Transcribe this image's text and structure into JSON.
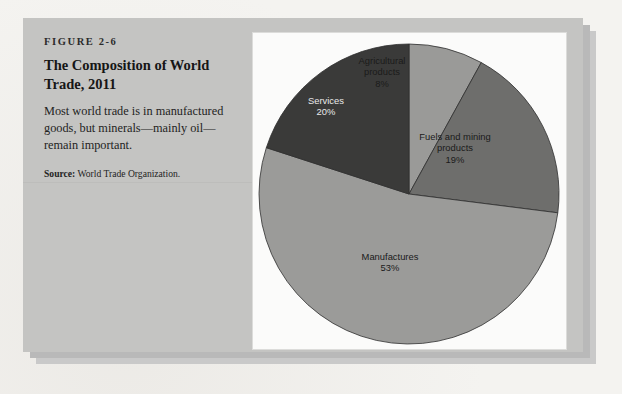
{
  "figure": {
    "number": "FIGURE 2-6",
    "title": "The Composition of World Trade, 2011",
    "description": "Most world trade is in manufactured goods, but minerals—mainly oil—remain important.",
    "source_label": "Source:",
    "source_text": " World Trade Organization."
  },
  "chart_data": {
    "type": "pie",
    "title": "The Composition of World Trade, 2011",
    "subtitle": "",
    "xlabel": "",
    "ylabel": "",
    "legend_position": "none",
    "grid": false,
    "units": "percent",
    "start_angle_deg": 0,
    "direction": "clockwise",
    "categories": [
      "Agricultural products",
      "Fuels and mining products",
      "Manufactures",
      "Services"
    ],
    "values": [
      8,
      19,
      53,
      20
    ],
    "slices": [
      {
        "name": "Agricultural products",
        "value": 8,
        "value_label": "8%",
        "label_line1": "Agricultural",
        "label_line2": "products",
        "color": "#9a9a98",
        "text_color": "light"
      },
      {
        "name": "Fuels and mining products",
        "value": 19,
        "value_label": "19%",
        "label_line1": "Fuels and mining",
        "label_line2": "products",
        "color": "#6e6e6c",
        "text_color": "light"
      },
      {
        "name": "Manufactures",
        "value": 53,
        "value_label": "53%",
        "label_line1": "Manufactures",
        "label_line2": "",
        "color": "#9b9b99",
        "text_color": "light"
      },
      {
        "name": "Services",
        "value": 20,
        "value_label": "20%",
        "label_line1": "Services",
        "label_line2": "",
        "color": "#3a3a39",
        "text_color": "dark"
      }
    ]
  },
  "colors": {
    "panel_background": "#c4c4c2",
    "chart_background": "#fbfbfa",
    "page_background": "#f3f2ef",
    "shadow": "#b9b9b9"
  }
}
